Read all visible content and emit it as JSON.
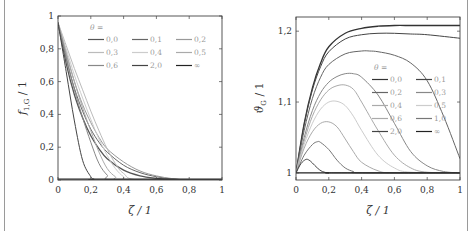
{
  "chart_data": [
    {
      "type": "line",
      "title": "",
      "xlabel": "ζ / 1",
      "ylabel": "f1,G / 1",
      "ylabel_main": "f",
      "ylabel_sub": "1,G",
      "ylabel_suffix": " / 1",
      "xlim": [
        0,
        1
      ],
      "ylim": [
        0,
        1
      ],
      "xticks": [
        "0",
        "0,2",
        "0,4",
        "0,6",
        "0,8",
        "1"
      ],
      "yticks": [
        "0",
        "0,2",
        "0,4",
        "0,6",
        "0,8",
        "1"
      ],
      "grid": false,
      "legend_title": "θ =",
      "legend_position": "upper right",
      "series": [
        {
          "name": "0,0",
          "color": "#555555",
          "x": [
            0,
            0.05,
            0.1,
            0.15,
            0.2,
            0.25,
            0.3,
            0.4,
            0.5,
            0.6,
            0.7,
            0.8,
            1
          ],
          "values": [
            0.96,
            0.71,
            0.52,
            0.38,
            0.27,
            0.19,
            0.13,
            0.06,
            0.025,
            0.01,
            0.003,
            0,
            0
          ]
        },
        {
          "name": "0,1",
          "color": "#666666",
          "x": [
            0,
            0.05,
            0.1,
            0.15,
            0.2,
            0.25,
            0.3,
            0.4,
            0.5,
            0.6,
            0.7,
            0.8,
            1
          ],
          "values": [
            0.96,
            0.74,
            0.56,
            0.42,
            0.31,
            0.23,
            0.17,
            0.09,
            0.045,
            0.02,
            0.006,
            0,
            0
          ]
        },
        {
          "name": "0,2",
          "color": "#999999",
          "x": [
            0,
            0.05,
            0.1,
            0.15,
            0.2,
            0.25,
            0.3,
            0.4,
            0.5,
            0.6,
            0.7,
            0.8,
            1
          ],
          "values": [
            0.96,
            0.77,
            0.6,
            0.46,
            0.35,
            0.26,
            0.19,
            0.11,
            0.055,
            0.025,
            0.008,
            0,
            0
          ]
        },
        {
          "name": "0,3",
          "color": "#bbbbbb",
          "x": [
            0,
            0.05,
            0.1,
            0.15,
            0.2,
            0.25,
            0.3,
            0.35,
            0.4,
            0.5,
            1
          ],
          "values": [
            0.96,
            0.82,
            0.68,
            0.55,
            0.42,
            0.3,
            0.19,
            0.1,
            0.04,
            0,
            0
          ]
        },
        {
          "name": "0,4",
          "color": "#cccccc",
          "x": [
            0,
            0.05,
            0.1,
            0.15,
            0.2,
            0.25,
            0.3,
            0.35,
            0.4,
            0.45,
            1
          ],
          "values": [
            0.96,
            0.8,
            0.64,
            0.5,
            0.37,
            0.25,
            0.15,
            0.07,
            0.02,
            0,
            0
          ]
        },
        {
          "name": "0,5",
          "color": "#aaaaaa",
          "x": [
            0,
            0.05,
            0.1,
            0.15,
            0.2,
            0.25,
            0.3,
            0.35,
            0.4,
            1
          ],
          "values": [
            0.96,
            0.78,
            0.6,
            0.44,
            0.3,
            0.17,
            0.07,
            0.02,
            0,
            0
          ]
        },
        {
          "name": "0,6",
          "color": "#888888",
          "x": [
            0,
            0.05,
            0.1,
            0.15,
            0.2,
            0.25,
            0.3,
            0.35,
            1
          ],
          "values": [
            0.96,
            0.75,
            0.55,
            0.38,
            0.23,
            0.1,
            0.03,
            0,
            0
          ]
        },
        {
          "name": "2,0",
          "color": "#444444",
          "x": [
            0,
            0.05,
            0.1,
            0.15,
            0.2,
            0.22,
            0.25,
            1
          ],
          "values": [
            0.96,
            0.66,
            0.36,
            0.12,
            0.02,
            0.005,
            0,
            0
          ]
        },
        {
          "name": "∞",
          "color": "#222222",
          "x": [
            0,
            1
          ],
          "values": [
            0.005,
            0.005
          ]
        }
      ]
    },
    {
      "type": "line",
      "title": "",
      "xlabel": "ζ / 1",
      "ylabel": "ϑG / 1",
      "ylabel_main": "ϑ",
      "ylabel_sub": "G",
      "ylabel_suffix": " / 1",
      "xlim": [
        0,
        1
      ],
      "ylim": [
        0.99,
        1.22
      ],
      "xticks": [
        "0",
        "0,2",
        "0,4",
        "0,6",
        "0,8",
        "1"
      ],
      "yticks": [
        "1",
        "1,1",
        "1,2"
      ],
      "grid": false,
      "legend_title": "θ =",
      "legend_position": "center right",
      "series": [
        {
          "name": "0,0",
          "color": "#333333",
          "x": [
            0,
            0.05,
            0.1,
            0.15,
            0.2,
            0.3,
            0.4,
            0.5,
            0.6,
            0.7,
            0.8,
            1
          ],
          "values": [
            1.0,
            1.07,
            1.12,
            1.155,
            1.178,
            1.197,
            1.204,
            1.207,
            1.208,
            1.208,
            1.208,
            1.208
          ]
        },
        {
          "name": "0,1",
          "color": "#444444",
          "x": [
            0,
            0.05,
            0.1,
            0.15,
            0.2,
            0.3,
            0.4,
            0.5,
            0.6,
            0.7,
            0.8,
            1
          ],
          "values": [
            1.0,
            1.068,
            1.117,
            1.15,
            1.171,
            1.189,
            1.195,
            1.197,
            1.197,
            1.196,
            1.195,
            1.19
          ]
        },
        {
          "name": "0,2",
          "color": "#666666",
          "x": [
            0,
            0.05,
            0.1,
            0.15,
            0.2,
            0.3,
            0.4,
            0.45,
            0.5,
            0.6,
            0.7,
            0.8,
            0.9,
            1
          ],
          "values": [
            1.0,
            1.06,
            1.105,
            1.135,
            1.153,
            1.168,
            1.172,
            1.172,
            1.171,
            1.166,
            1.155,
            1.13,
            1.08,
            1.02
          ]
        },
        {
          "name": "0,3",
          "color": "#888888",
          "x": [
            0,
            0.05,
            0.1,
            0.15,
            0.2,
            0.25,
            0.3,
            0.35,
            0.4,
            0.5,
            0.6,
            0.7,
            0.8,
            0.9,
            1
          ],
          "values": [
            1.0,
            1.05,
            1.088,
            1.113,
            1.128,
            1.136,
            1.14,
            1.14,
            1.135,
            1.11,
            1.07,
            1.03,
            1.01,
            1.002,
            1.0
          ]
        },
        {
          "name": "0,4",
          "color": "#aaaaaa",
          "x": [
            0,
            0.05,
            0.1,
            0.15,
            0.2,
            0.25,
            0.3,
            0.35,
            0.4,
            0.5,
            0.6,
            0.7,
            0.8,
            1
          ],
          "values": [
            1.0,
            1.045,
            1.08,
            1.103,
            1.117,
            1.123,
            1.124,
            1.118,
            1.1,
            1.06,
            1.025,
            1.007,
            1.001,
            1.0
          ]
        },
        {
          "name": "0,5",
          "color": "#cccccc",
          "x": [
            0,
            0.05,
            0.1,
            0.15,
            0.2,
            0.25,
            0.3,
            0.35,
            0.4,
            0.5,
            0.6,
            0.7,
            1
          ],
          "values": [
            1.0,
            1.04,
            1.07,
            1.09,
            1.1,
            1.101,
            1.095,
            1.08,
            1.06,
            1.025,
            1.007,
            1.001,
            1.0
          ]
        },
        {
          "name": "0,6",
          "color": "#aaaaaa",
          "x": [
            0,
            0.05,
            0.1,
            0.15,
            0.2,
            0.25,
            0.3,
            0.35,
            0.4,
            0.5,
            0.6,
            1
          ],
          "values": [
            1.0,
            1.035,
            1.058,
            1.07,
            1.072,
            1.065,
            1.048,
            1.03,
            1.015,
            1.003,
            1.0,
            1.0
          ]
        },
        {
          "name": "1,0",
          "color": "#777777",
          "x": [
            0,
            0.05,
            0.1,
            0.13,
            0.15,
            0.2,
            0.25,
            0.3,
            0.35,
            0.4,
            1
          ],
          "values": [
            1.0,
            1.025,
            1.04,
            1.044,
            1.043,
            1.033,
            1.018,
            1.007,
            1.002,
            1.0,
            1.0
          ]
        },
        {
          "name": "2,0",
          "color": "#444444",
          "x": [
            0,
            0.03,
            0.06,
            0.08,
            0.1,
            0.13,
            0.16,
            0.2,
            0.25,
            1
          ],
          "values": [
            1.0,
            1.013,
            1.019,
            1.018,
            1.014,
            1.007,
            1.002,
            1.0,
            1.0,
            1.0
          ]
        },
        {
          "name": "∞",
          "color": "#222222",
          "x": [
            0,
            1
          ],
          "values": [
            1.0,
            1.0
          ]
        }
      ]
    }
  ]
}
